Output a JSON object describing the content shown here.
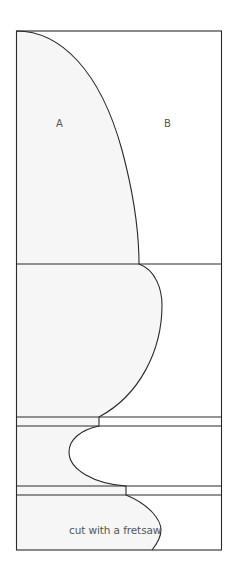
{
  "diagram": {
    "title": "",
    "labels": {
      "region_a": "A",
      "region_b": "B",
      "note": "cut with a fretsaw"
    },
    "colors": {
      "stroke": "#2a2a2a",
      "fill_a": "#f6f6f6",
      "fill_b": "#ffffff",
      "text": "#555555"
    },
    "frame": {
      "left": 16.5,
      "top": 31,
      "right": 221.5,
      "bottom": 550
    },
    "horizontal_lines_y": [
      264,
      417,
      426,
      486,
      495
    ],
    "sections": [
      {
        "name": "top-ogee-section",
        "y_from": 31,
        "y_to": 264
      },
      {
        "name": "bulb-section",
        "y_from": 264,
        "y_to": 417
      },
      {
        "name": "fillet-1",
        "y_from": 417,
        "y_to": 426
      },
      {
        "name": "cove-section",
        "y_from": 426,
        "y_to": 486
      },
      {
        "name": "fillet-2",
        "y_from": 486,
        "y_to": 495
      },
      {
        "name": "bottom-section",
        "y_from": 495,
        "y_to": 550
      }
    ]
  }
}
